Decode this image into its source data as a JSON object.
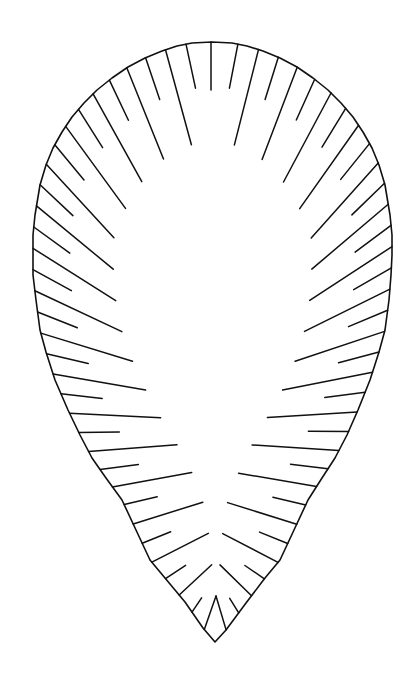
{
  "figure": {
    "width": 417,
    "height": 687,
    "stroke_color": "#111111",
    "background": "#ffffff",
    "outer_left": [
      [
        215,
        642
      ],
      [
        203,
        628
      ],
      [
        185,
        602
      ],
      [
        165,
        578
      ],
      [
        150,
        560
      ],
      [
        136,
        530
      ],
      [
        122,
        500
      ],
      [
        106,
        478
      ],
      [
        92,
        458
      ],
      [
        80,
        435
      ],
      [
        68,
        410
      ],
      [
        55,
        380
      ],
      [
        46,
        352
      ],
      [
        40,
        330
      ],
      [
        36,
        300
      ],
      [
        33,
        275
      ],
      [
        33,
        255
      ],
      [
        33,
        235
      ],
      [
        35,
        215
      ],
      [
        40,
        185
      ],
      [
        46,
        165
      ],
      [
        53,
        148
      ],
      [
        62,
        132
      ],
      [
        72,
        117
      ],
      [
        84,
        103
      ],
      [
        97,
        90
      ],
      [
        112,
        78
      ],
      [
        128,
        67
      ],
      [
        145,
        58
      ],
      [
        162,
        51
      ],
      [
        177,
        46
      ],
      [
        192,
        43
      ],
      [
        212,
        42
      ]
    ],
    "outer_right": [
      [
        215,
        642
      ],
      [
        226,
        630
      ],
      [
        246,
        603
      ],
      [
        265,
        578
      ],
      [
        280,
        560
      ],
      [
        294,
        530
      ],
      [
        308,
        500
      ],
      [
        322,
        478
      ],
      [
        335,
        458
      ],
      [
        347,
        435
      ],
      [
        358,
        410
      ],
      [
        370,
        380
      ],
      [
        379,
        352
      ],
      [
        385,
        330
      ],
      [
        389,
        300
      ],
      [
        391,
        275
      ],
      [
        392,
        255
      ],
      [
        392,
        235
      ],
      [
        390,
        215
      ],
      [
        385,
        185
      ],
      [
        379,
        165
      ],
      [
        372,
        148
      ],
      [
        363,
        132
      ],
      [
        353,
        117
      ],
      [
        341,
        103
      ],
      [
        328,
        90
      ],
      [
        313,
        78
      ],
      [
        297,
        67
      ],
      [
        280,
        58
      ],
      [
        263,
        51
      ],
      [
        247,
        46
      ],
      [
        232,
        43
      ],
      [
        212,
        42
      ]
    ],
    "inner_left": [
      [
        216,
        596
      ],
      [
        213,
        578
      ],
      [
        209,
        537
      ],
      [
        202,
        498
      ],
      [
        187,
        461
      ],
      [
        168,
        430
      ],
      [
        150,
        400
      ],
      [
        138,
        373
      ],
      [
        125,
        345
      ],
      [
        118,
        315
      ],
      [
        114,
        290
      ],
      [
        113,
        263
      ],
      [
        113,
        240
      ],
      [
        122,
        217
      ],
      [
        130,
        197
      ],
      [
        143,
        180
      ],
      [
        155,
        165
      ],
      [
        172,
        153
      ],
      [
        190,
        145
      ],
      [
        207,
        142
      ]
    ],
    "inner_right": [
      [
        216,
        596
      ],
      [
        219,
        578
      ],
      [
        222,
        538
      ],
      [
        228,
        500
      ],
      [
        243,
        462
      ],
      [
        261,
        428
      ],
      [
        278,
        400
      ],
      [
        291,
        372
      ],
      [
        302,
        343
      ],
      [
        308,
        315
      ],
      [
        311,
        290
      ],
      [
        312,
        263
      ],
      [
        312,
        240
      ],
      [
        303,
        217
      ],
      [
        295,
        197
      ],
      [
        282,
        180
      ],
      [
        270,
        165
      ],
      [
        253,
        153
      ],
      [
        235,
        145
      ],
      [
        219,
        142
      ]
    ],
    "hatch": {
      "lines_per_side": 34,
      "short_fraction": 0.45,
      "first_index_long": true
    },
    "center_line": {
      "x1": 211,
      "y1": 42,
      "x2": 211,
      "y2": 90
    },
    "tip_peak": {
      "x": 216,
      "y": 596
    }
  }
}
